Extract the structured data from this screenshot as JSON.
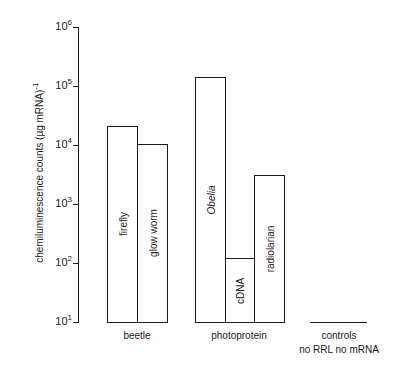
{
  "chart_data": {
    "type": "bar",
    "title": "",
    "xlabel": "",
    "ylabel": "chemiluminescence counts (µg mRNA)",
    "ylabel_superscript": "-1",
    "yscale": "log",
    "ylim": [
      10,
      1000000
    ],
    "yticks": [
      {
        "base": "10",
        "exp": "1",
        "value": 10
      },
      {
        "base": "10",
        "exp": "2",
        "value": 100
      },
      {
        "base": "10",
        "exp": "3",
        "value": 1000
      },
      {
        "base": "10",
        "exp": "4",
        "value": 10000
      },
      {
        "base": "10",
        "exp": "5",
        "value": 100000
      },
      {
        "base": "10",
        "exp": "6",
        "value": 1000000
      }
    ],
    "grid": false,
    "legend": null,
    "groups": [
      {
        "name": "beetle",
        "bars": [
          {
            "label": "firefly",
            "value": 21000,
            "italic": false
          },
          {
            "label": "glow worm",
            "value": 10500,
            "italic": false
          }
        ]
      },
      {
        "name": "photoprotein",
        "bars": [
          {
            "label": "Obelia",
            "value": 140000,
            "italic": true
          },
          {
            "label": "cDNA",
            "value": 120,
            "italic": false
          },
          {
            "label": "radiolarian",
            "value": 3100,
            "italic": false
          }
        ]
      },
      {
        "name": "controls",
        "sublabel": "no RRL  no mRNA",
        "bars": [
          {
            "label": "no RRL",
            "value": 10
          },
          {
            "label": "no mRNA",
            "value": 10
          }
        ]
      }
    ]
  },
  "layout": {
    "axis_x": 78,
    "y_base_px": 322,
    "px_per_decade": 59,
    "bar_x": {
      "firefly": [
        107,
        137
      ],
      "glow worm": [
        137,
        167
      ],
      "Obelia": [
        195,
        225
      ],
      "cDNA": [
        225,
        254
      ],
      "radiolarian": [
        254,
        284
      ]
    },
    "controls_line": [
      310,
      367
    ]
  }
}
